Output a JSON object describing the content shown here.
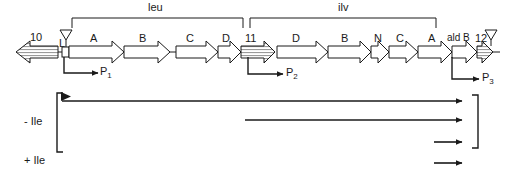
{
  "figure": {
    "type": "gene-organization-map",
    "operon_brackets": [
      {
        "id": "leu",
        "label": "leu",
        "x_start": 72,
        "x_end": 243,
        "label_x": 157,
        "label_y": 10
      },
      {
        "id": "ilv",
        "label": "ilv",
        "x_start": 250,
        "x_end": 436,
        "label_x": 343,
        "label_y": 10
      }
    ],
    "genes": [
      {
        "id": "g10",
        "label": "10",
        "x": 18,
        "width": 40,
        "direction": "left",
        "shaded": true,
        "label_x": 38,
        "label_y": 37
      },
      {
        "id": "leuL",
        "label": "L",
        "x": 62,
        "width": 8,
        "direction": "right",
        "shaded": false,
        "label_x": 61,
        "label_y": 41
      },
      {
        "id": "leuA",
        "label": "A",
        "x": 70,
        "width": 52,
        "direction": "right",
        "shaded": false,
        "label_x": 94,
        "label_y": 37
      },
      {
        "id": "leuB",
        "label": "B",
        "x": 123,
        "width": 45,
        "direction": "right",
        "shaded": false,
        "label_x": 143,
        "label_y": 37
      },
      {
        "id": "leuC",
        "label": "C",
        "x": 169,
        "width": 48,
        "direction": "right",
        "shaded": false,
        "label_x": 190,
        "label_y": 37
      },
      {
        "id": "leuD",
        "label": "D",
        "x": 198,
        "width": 24,
        "direction": "right",
        "shaded": false,
        "label_x": 207,
        "label_y": 37
      },
      {
        "id": "g11",
        "label": "11",
        "x": 220,
        "width": 30,
        "direction": "right",
        "shaded": true,
        "label_x": 233,
        "label_y": 37
      },
      {
        "id": "ilvD",
        "label": "D",
        "x": 252,
        "width": 60,
        "direction": "right",
        "shaded": false,
        "label_x": 278,
        "label_y": 37
      },
      {
        "id": "ilvB",
        "label": "B",
        "x": 312,
        "width": 48,
        "direction": "right",
        "shaded": false,
        "label_x": 333,
        "label_y": 37
      },
      {
        "id": "ilvN",
        "label": "N",
        "x": 352,
        "width": 22,
        "direction": "right",
        "shaded": false,
        "label_x": 360,
        "label_y": 37
      },
      {
        "id": "ilvC",
        "label": "C",
        "x": 374,
        "width": 42,
        "direction": "right",
        "shaded": false,
        "label_x": 390,
        "label_y": 37
      },
      {
        "id": "ilvA",
        "label": "A",
        "x": 402,
        "width": 50,
        "direction": "right",
        "shaded": false,
        "label_x": 424,
        "label_y": 37
      },
      {
        "id": "aldB",
        "label": "ald B",
        "x": 452,
        "width": 26,
        "direction": "right",
        "shaded": false,
        "label_x": 450,
        "label_y": 37
      },
      {
        "id": "g12",
        "label": "12",
        "x": 474,
        "width": 18,
        "direction": "right",
        "shaded": true,
        "label_x": 478,
        "label_y": 37
      }
    ],
    "terminators": [
      {
        "id": "term-leuL",
        "symbol": "triangle-down",
        "x": 66,
        "y": 30
      },
      {
        "id": "term-12",
        "symbol": "triangle-down",
        "x": 490,
        "y": 30
      }
    ],
    "promoters": [
      {
        "id": "P1",
        "label": "P",
        "subscript": "1",
        "tick_x": 64,
        "label_x": 103,
        "label_y": 72
      },
      {
        "id": "P2",
        "label": "P",
        "subscript": "2",
        "tick_x": 248,
        "label_x": 288,
        "label_y": 72
      },
      {
        "id": "P3",
        "label": "P",
        "subscript": "3",
        "tick_x": 452,
        "label_x": 484,
        "label_y": 77
      }
    ],
    "transcripts": [
      {
        "id": "t1",
        "x_start": 62,
        "x_end": 468,
        "y": 101,
        "condition": "- Ile",
        "start_marker": "arrowhead-right"
      },
      {
        "id": "t2",
        "x_start": 245,
        "x_end": 468,
        "y": 120,
        "condition": "- Ile",
        "start_marker": "none"
      },
      {
        "id": "t3",
        "x_start": 434,
        "x_end": 468,
        "y": 142,
        "condition": "- Ile",
        "start_marker": "none"
      },
      {
        "id": "t4",
        "x_start": 434,
        "x_end": 468,
        "y": 163,
        "condition": "+ Ile",
        "start_marker": "none"
      }
    ],
    "conditions": [
      {
        "id": "minus-ile",
        "label": "- Ile",
        "label_x": 26,
        "label_y": 122,
        "bracket_x_left": 57,
        "bracket_top": 93,
        "bracket_bottom": 152,
        "bracket_x_right": 478
      },
      {
        "id": "plus-ile",
        "label": "+ Ile",
        "label_x": 26,
        "label_y": 160
      }
    ]
  }
}
